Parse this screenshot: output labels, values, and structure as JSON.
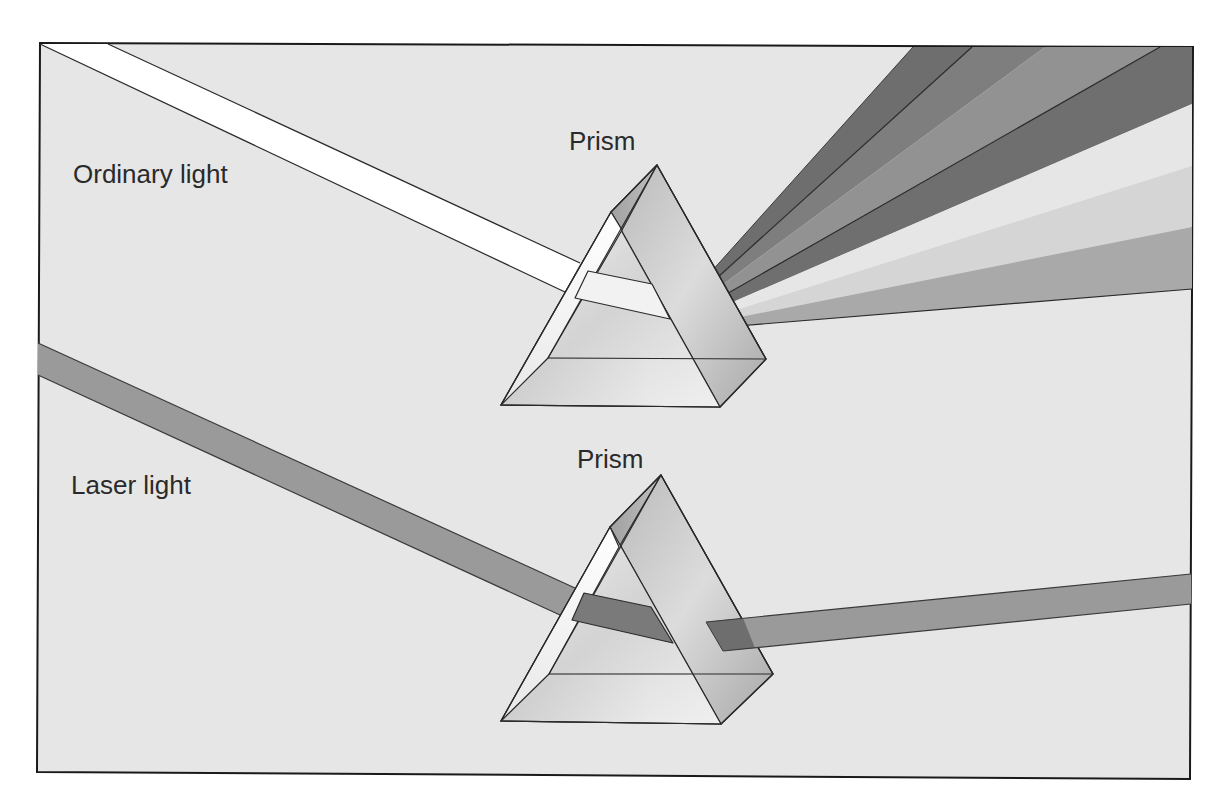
{
  "diagram": {
    "labels": {
      "ordinary_light": "Ordinary light",
      "laser_light": "Laser light",
      "top_prism": "Prism",
      "bottom_prism": "Prism"
    },
    "colors": {
      "background": "#ffffff",
      "panel": "#e6e6e6",
      "frame": "#1a1a1a",
      "white_beam": "#ffffff",
      "laser_beam": "#9a9a9a",
      "laser_inside": "#7a7a7a",
      "prism_edge": "#2a2a2a",
      "spectrum_bands": [
        "#6e6e6e",
        "#7e7e7e",
        "#929292",
        "#6f6f6f",
        "#e6e6e6",
        "#d5d5d5",
        "#a9a9a9"
      ]
    },
    "elements": [
      {
        "id": "ordinary-light-beam",
        "type": "white beam",
        "enters": "top-prism"
      },
      {
        "id": "top-prism",
        "type": "triangular prism"
      },
      {
        "id": "spectrum-fan",
        "type": "dispersed spectrum",
        "band_count": 7
      },
      {
        "id": "laser-light-beam",
        "type": "single-color beam",
        "enters": "bottom-prism"
      },
      {
        "id": "bottom-prism",
        "type": "triangular prism"
      },
      {
        "id": "laser-exit-beam",
        "type": "undispersed beam"
      }
    ]
  }
}
